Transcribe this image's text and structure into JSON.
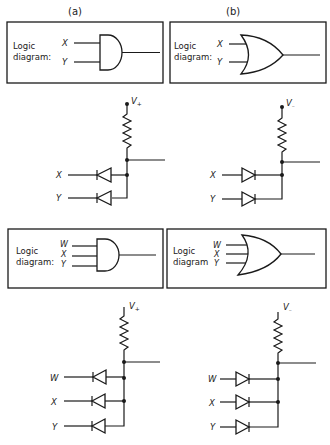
{
  "panels": [
    {
      "id": "a",
      "label": "(a)",
      "gate_type": "AND",
      "logic_two": {
        "caption_line1": "Logic",
        "caption_line2": "diagram:",
        "inputs": [
          "X",
          "Y"
        ]
      },
      "circuit_two": {
        "supply": "V+",
        "supply_main": "V",
        "supply_sub": "+",
        "inputs": [
          "X",
          "Y"
        ],
        "diode_direction": "cathode-to-input"
      },
      "logic_three": {
        "caption_line1": "Logic",
        "caption_line2": "diagram:",
        "inputs": [
          "W",
          "X",
          "Y"
        ]
      },
      "circuit_three": {
        "supply": "V+",
        "supply_main": "V",
        "supply_sub": "+",
        "inputs": [
          "W",
          "X",
          "Y"
        ],
        "diode_direction": "cathode-to-input"
      }
    },
    {
      "id": "b",
      "label": "(b)",
      "gate_type": "OR",
      "logic_two": {
        "caption_line1": "Logic",
        "caption_line2": "diagram:",
        "inputs": [
          "X",
          "Y"
        ]
      },
      "circuit_two": {
        "supply": "V-",
        "supply_main": "V",
        "supply_sub": "–",
        "inputs": [
          "X",
          "Y"
        ],
        "diode_direction": "anode-to-input"
      },
      "logic_three": {
        "caption_line1": "Logic",
        "caption_line2": "diagram",
        "inputs": [
          "W",
          "X",
          "Y"
        ]
      },
      "circuit_three": {
        "supply": "V-",
        "supply_main": "V",
        "supply_sub": "–",
        "inputs": [
          "W",
          "X",
          "Y"
        ],
        "diode_direction": "anode-to-input"
      }
    }
  ],
  "colors": {
    "ink": "#1a1a1a",
    "background": "#ffffff"
  }
}
